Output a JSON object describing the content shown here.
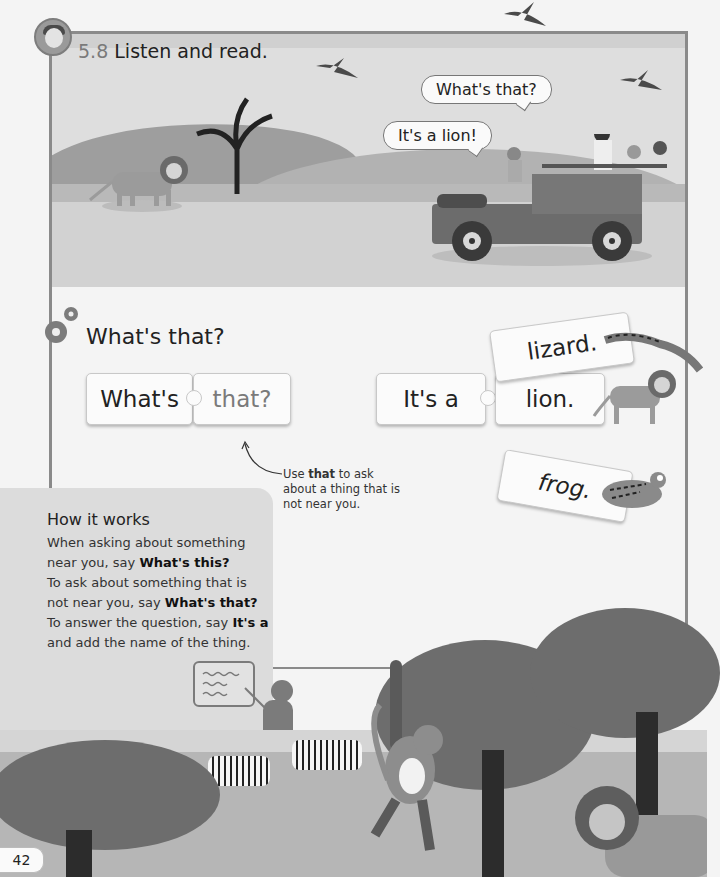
{
  "header": {
    "audio_icon": "headphones-avatar-icon",
    "track_number": "5.8",
    "instruction": "Listen and read."
  },
  "scene": {
    "bubbles": [
      {
        "text": "What's that?"
      },
      {
        "text": "It's a lion!"
      }
    ]
  },
  "grammar": {
    "icon": "gears-icon",
    "title": "What's that?",
    "question_pieces": [
      {
        "text": "What's"
      },
      {
        "text": "that?"
      }
    ],
    "answer_pieces": [
      {
        "text": "It's a"
      },
      {
        "text": "lion."
      },
      {
        "text": "lizard."
      },
      {
        "text": "frog."
      }
    ],
    "note": {
      "pre": "Use ",
      "bold": "that",
      "post": " to ask about a thing that is not near you."
    }
  },
  "how_it_works": {
    "title": "How it works",
    "p1_pre": "When asking about something near you, say ",
    "p1_bold": "What's this?",
    "p2_pre": "To ask about something that is not near you, say ",
    "p2_bold": "What's that?",
    "p3_pre": "To answer the question, say ",
    "p3_bold": "It's a",
    "p3_post": " and add the name of the thing."
  },
  "footer": {
    "page_number": "42"
  }
}
